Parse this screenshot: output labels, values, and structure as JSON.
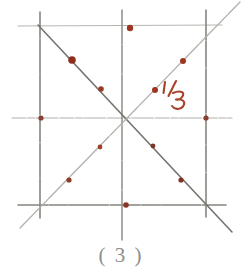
{
  "figure": {
    "caption": "( 3 )",
    "annotation_label": "1/3",
    "colors": {
      "grid_line": "#8a8a86",
      "diagonal_line": "#6e6b66",
      "faint_line": "#b9b9b5",
      "dot": "#a33a22",
      "dot_dark": "#7e2a18",
      "ink": "#a8432b",
      "caption": "#8e8e8e",
      "background": "#ffffff"
    },
    "square": {
      "left": 38,
      "top": 25,
      "right": 206,
      "bottom": 205,
      "center_x": 122,
      "center_y": 118
    },
    "lines": [
      {
        "name": "top-edge",
        "x1": 18,
        "y1": 26,
        "x2": 222,
        "y2": 25,
        "kind": "faint-horizontal"
      },
      {
        "name": "middle-horizontal",
        "x1": 12,
        "y1": 118,
        "x2": 232,
        "y2": 118,
        "kind": "faint-horizontal"
      },
      {
        "name": "bottom-edge",
        "x1": 18,
        "y1": 205,
        "x2": 226,
        "y2": 205,
        "kind": "grid-horizontal"
      },
      {
        "name": "left-edge",
        "x1": 40,
        "y1": 12,
        "x2": 40,
        "y2": 218,
        "kind": "grid-vertical"
      },
      {
        "name": "middle-vertical",
        "x1": 122,
        "y1": 10,
        "x2": 122,
        "y2": 240,
        "kind": "grid-vertical"
      },
      {
        "name": "right-edge",
        "x1": 206,
        "y1": 10,
        "x2": 206,
        "y2": 218,
        "kind": "grid-vertical"
      },
      {
        "name": "descending-diagonal",
        "x1": 38,
        "y1": 25,
        "x2": 232,
        "y2": 232,
        "kind": "diagonal"
      },
      {
        "name": "ascending-diagonal",
        "x1": 20,
        "y1": 228,
        "x2": 240,
        "y2": 2,
        "kind": "diagonal-faint"
      }
    ],
    "dots": [
      {
        "name": "dot-top-center",
        "x": 130,
        "y": 28,
        "r": 3.2
      },
      {
        "name": "dot-descending-upper",
        "x": 72,
        "y": 60,
        "r": 3.6
      },
      {
        "name": "dot-descending-mid",
        "x": 101,
        "y": 89,
        "r": 2.8
      },
      {
        "name": "dot-left-middle",
        "x": 41,
        "y": 118,
        "r": 2.6
      },
      {
        "name": "dot-right-middle",
        "x": 206,
        "y": 118,
        "r": 2.6
      },
      {
        "name": "dot-ascending-upper",
        "x": 183,
        "y": 61,
        "r": 3.0
      },
      {
        "name": "dot-ascending-label-point",
        "x": 155,
        "y": 90,
        "r": 3.0
      },
      {
        "name": "dot-ascending-lower",
        "x": 100,
        "y": 147,
        "r": 2.4
      },
      {
        "name": "dot-ascending-bottom",
        "x": 69,
        "y": 180,
        "r": 2.6
      },
      {
        "name": "dot-descending-lower",
        "x": 153,
        "y": 146,
        "r": 2.4
      },
      {
        "name": "dot-descending-bottom",
        "x": 181,
        "y": 180,
        "r": 2.6
      },
      {
        "name": "dot-bottom-center",
        "x": 126,
        "y": 205,
        "r": 2.8
      }
    ]
  }
}
